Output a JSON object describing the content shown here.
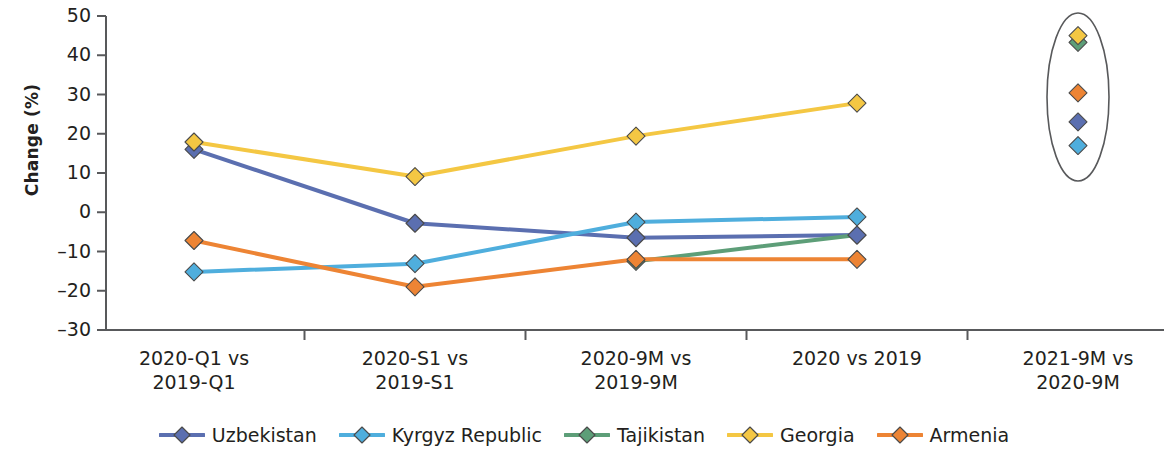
{
  "chart_data": {
    "type": "line",
    "title": "",
    "xlabel": "",
    "ylabel": "Change (%)",
    "ylim": [
      -30,
      50
    ],
    "ytick_step": 10,
    "yticks": [
      "50",
      "40",
      "30",
      "20",
      "10",
      "0",
      "–10",
      "–20",
      "–30"
    ],
    "grid": false,
    "legend_position": "bottom",
    "categories": [
      "2020-Q1 vs 2019-Q1",
      "2020-S1 vs 2019-S1",
      "2020-9M vs 2019-9M",
      "2020 vs 2019",
      "2021-9M vs 2020-9M"
    ],
    "category_lines": [
      [
        "2020-Q1 vs",
        "2019-Q1"
      ],
      [
        "2020-S1 vs",
        "2019-S1"
      ],
      [
        "2020-9M vs",
        "2019-9M"
      ],
      [
        "2020 vs 2019",
        ""
      ],
      [
        "2021-9M vs",
        "2020-9M"
      ]
    ],
    "series": [
      {
        "name": "Uzbekistan",
        "color": "#5B6FB0",
        "values": [
          16.0,
          -2.8,
          -6.5,
          -5.8,
          23.0
        ],
        "connected_through": 4
      },
      {
        "name": "Kyrgyz Republic",
        "color": "#4FAEDD",
        "values": [
          -15.2,
          -13.1,
          -2.5,
          -1.2,
          17.0
        ],
        "connected_through": 4
      },
      {
        "name": "Tajikistan",
        "color": "#5D9E78",
        "values": [
          null,
          null,
          -12.5,
          -5.8,
          43.3
        ],
        "connected_through": 4
      },
      {
        "name": "Georgia",
        "color": "#F4C743",
        "values": [
          17.9,
          9.1,
          19.4,
          27.8,
          45.0
        ],
        "connected_through": 4
      },
      {
        "name": "Armenia",
        "color": "#ED8434",
        "values": [
          -7.2,
          -19.0,
          -12.0,
          -12.0,
          30.4
        ],
        "connected_through": 4
      }
    ],
    "annotations": [
      {
        "type": "ellipse",
        "name": "highlight-ellipse",
        "target_category": "2021-9M vs 2020-9M",
        "center_x": 1078,
        "center_y": 97,
        "radius_x": 31,
        "radius_y": 84,
        "stroke": "#58595B"
      }
    ]
  },
  "legend": {
    "items": [
      {
        "label": "Uzbekistan",
        "color": "#5B6FB0"
      },
      {
        "label": "Kyrgyz Republic",
        "color": "#4FAEDD"
      },
      {
        "label": "Tajikistan",
        "color": "#5D9E78"
      },
      {
        "label": "Georgia",
        "color": "#F4C743"
      },
      {
        "label": "Armenia",
        "color": "#ED8434"
      }
    ]
  },
  "axis": {
    "y_title": "Change (%)"
  }
}
